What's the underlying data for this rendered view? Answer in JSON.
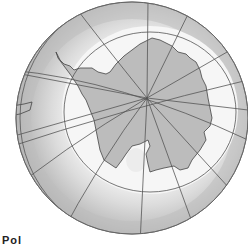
{
  "figure": {
    "colors": {
      "ocean_outer": "#b4b4b4",
      "ocean_mid": "#d2d2d2",
      "ice_shelf": "#f4f4f4",
      "land": "#bdbdbd",
      "grid_lines": "#555555",
      "background": "#ffffff"
    },
    "caption_partial": "Pol"
  }
}
